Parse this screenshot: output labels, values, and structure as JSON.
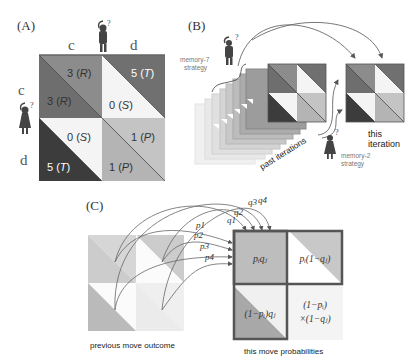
{
  "panels": {
    "A": {
      "label": "(A)",
      "col_headers": [
        "c",
        "d"
      ],
      "row_headers": [
        "c",
        "d"
      ],
      "cells": {
        "cc": {
          "upper": "3 (R)",
          "upper_num": "3",
          "upper_sym": "R",
          "lower": "3 (R)",
          "lower_num": "3",
          "lower_sym": "R"
        },
        "cd": {
          "upper": "5 (T)",
          "upper_num": "5",
          "upper_sym": "T",
          "lower": "0 (S)",
          "lower_num": "0",
          "lower_sym": "S"
        },
        "dc": {
          "upper": "0 (S)",
          "upper_num": "0",
          "upper_sym": "S",
          "lower": "5 (T)",
          "lower_num": "5",
          "lower_sym": "T"
        },
        "dd": {
          "upper": "1 (P)",
          "upper_num": "1",
          "upper_sym": "P",
          "lower": "1 (P)",
          "lower_num": "1",
          "lower_sym": "P"
        }
      },
      "player_question_mark": "?"
    },
    "B": {
      "label": "(B)",
      "memory7_line1": "memory-7",
      "memory7_line2": "strategy",
      "memory2_line1": "memory-2",
      "memory2_line2": "strategy",
      "past_label": "past iterations",
      "this_line1": "this",
      "this_line2": "iteration",
      "question_mark": "?"
    },
    "C": {
      "label": "(C)",
      "p_labels": [
        "p1",
        "p2",
        "p3",
        "p4"
      ],
      "q_labels": [
        "q1",
        "q2",
        "q3",
        "q4"
      ],
      "cell_tl": "pᵢqⱼ",
      "cell_tr": "pᵢ(1−qⱼ)",
      "cell_bl": "(1−pᵢ)qⱼ",
      "cell_br_line1": "(1−pᵢ)",
      "cell_br_line2": "×(1−qⱼ)",
      "prev_caption": "previous move outcome",
      "this_caption": "this move probabilities"
    }
  },
  "colors": {
    "R_upper": "#8c8c8c",
    "R_lower": "#6e6e6e",
    "T_upper": "#707070",
    "S": "#f4f4f4",
    "T_lower": "#3c3c3c",
    "P": "#bdbdbd",
    "frame": "#555555"
  }
}
